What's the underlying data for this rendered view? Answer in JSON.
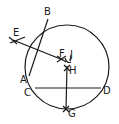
{
  "diagram": {
    "type": "geometric-construction",
    "circle": {
      "cx": 67,
      "cy": 67,
      "r": 42
    },
    "points": [
      {
        "id": "B",
        "label": "B",
        "x": 48,
        "y": 19,
        "lx": 44,
        "ly": 15
      },
      {
        "id": "A",
        "label": "A",
        "x": 29,
        "y": 76,
        "lx": 20,
        "ly": 83
      },
      {
        "id": "E",
        "label": "E",
        "x": 13,
        "y": 40,
        "lx": 13,
        "ly": 36
      },
      {
        "id": "F",
        "label": "F",
        "x": 61,
        "y": 59,
        "lx": 59,
        "ly": 57
      },
      {
        "id": "J",
        "label": "J",
        "x": 70,
        "y": 57,
        "lx": 70,
        "ly": 58
      },
      {
        "id": "H",
        "label": "H",
        "x": 67,
        "y": 68,
        "lx": 69,
        "ly": 74
      },
      {
        "id": "C",
        "label": "C",
        "x": 35,
        "y": 88,
        "lx": 24,
        "ly": 96
      },
      {
        "id": "D",
        "label": "D",
        "x": 101,
        "y": 88,
        "lx": 103,
        "ly": 94
      },
      {
        "id": "G",
        "label": "G",
        "x": 66,
        "y": 109,
        "lx": 68,
        "ly": 117
      }
    ],
    "segments": [
      {
        "from": "A",
        "to": "B",
        "name": "chord-ab"
      },
      {
        "from": "C",
        "to": "D",
        "name": "chord-cd"
      },
      {
        "from": "E",
        "to": "F",
        "name": "bisector-ab"
      },
      {
        "from": "H",
        "to": "G",
        "name": "bisector-cd"
      }
    ]
  }
}
